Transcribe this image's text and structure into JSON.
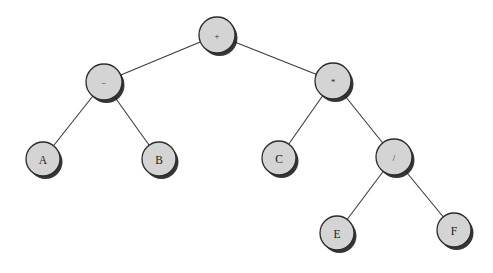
{
  "diagram": {
    "type": "binary-expression-tree",
    "background_color": "#ffffff",
    "node_fill_color": "#d4d4d4",
    "node_stroke_color": "#2b2b2b",
    "edge_color": "#3b3b3b",
    "expression": "(A - B) + (C * (E / F))",
    "nodes": [
      {
        "id": "n-plus",
        "label": "+",
        "kind": "operator",
        "cx": 217,
        "cy": 35,
        "r": 18
      },
      {
        "id": "n-minus",
        "label": "−",
        "kind": "operator",
        "cx": 104,
        "cy": 82,
        "r": 18
      },
      {
        "id": "n-times",
        "label": "*",
        "kind": "operator",
        "cx": 333,
        "cy": 81,
        "r": 18
      },
      {
        "id": "n-a",
        "label": "A",
        "kind": "operand",
        "cx": 43,
        "cy": 159,
        "r": 17
      },
      {
        "id": "n-b",
        "label": "B",
        "kind": "operand",
        "cx": 159,
        "cy": 159,
        "r": 17
      },
      {
        "id": "n-c",
        "label": "C",
        "kind": "operand",
        "cx": 279,
        "cy": 158,
        "r": 17
      },
      {
        "id": "n-div",
        "label": "/",
        "kind": "operator",
        "cx": 394,
        "cy": 157,
        "r": 18
      },
      {
        "id": "n-e",
        "label": "E",
        "kind": "operand",
        "cx": 337,
        "cy": 233,
        "r": 17
      },
      {
        "id": "n-f",
        "label": "F",
        "kind": "operand",
        "cx": 454,
        "cy": 230,
        "r": 17
      }
    ],
    "edges": [
      {
        "id": "edge-plus-minus",
        "from": "n-plus",
        "to": "n-minus",
        "x1": 217,
        "y1": 35,
        "x2": 104,
        "y2": 82
      },
      {
        "id": "edge-plus-times",
        "from": "n-plus",
        "to": "n-times",
        "x1": 217,
        "y1": 35,
        "x2": 333,
        "y2": 81
      },
      {
        "id": "edge-minus-a",
        "from": "n-minus",
        "to": "n-a",
        "x1": 104,
        "y1": 82,
        "x2": 43,
        "y2": 159
      },
      {
        "id": "edge-minus-b",
        "from": "n-minus",
        "to": "n-b",
        "x1": 104,
        "y1": 82,
        "x2": 159,
        "y2": 159
      },
      {
        "id": "edge-times-c",
        "from": "n-times",
        "to": "n-c",
        "x1": 333,
        "y1": 81,
        "x2": 279,
        "y2": 158
      },
      {
        "id": "edge-times-div",
        "from": "n-times",
        "to": "n-div",
        "x1": 333,
        "y1": 81,
        "x2": 394,
        "y2": 157
      },
      {
        "id": "edge-div-e",
        "from": "n-div",
        "to": "n-e",
        "x1": 394,
        "y1": 157,
        "x2": 337,
        "y2": 233
      },
      {
        "id": "edge-div-f",
        "from": "n-div",
        "to": "n-f",
        "x1": 394,
        "y1": 157,
        "x2": 454,
        "y2": 230
      }
    ]
  }
}
